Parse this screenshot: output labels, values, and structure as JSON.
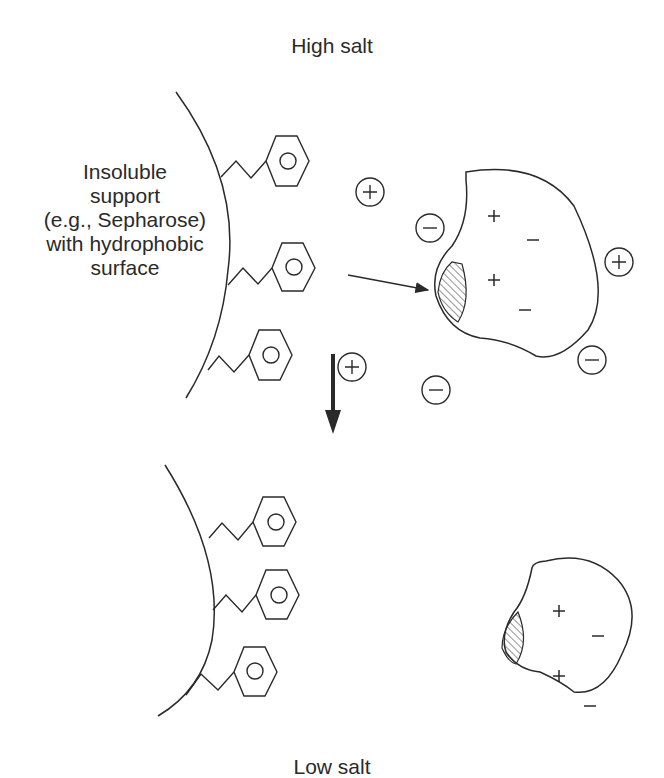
{
  "diagram": {
    "top_panel": {
      "condition_label": "High salt",
      "support_label_lines": [
        "Insoluble",
        "support",
        "(e.g., Sepharose)",
        "with hydrophobic",
        "surface"
      ],
      "ligand_icon": "phenyl-ring-icon",
      "ligand_count": 3,
      "protein_charges": [
        "+",
        "−",
        "+",
        "−"
      ],
      "free_ions": [
        "+",
        "−",
        "+",
        "−",
        "−",
        "+",
        "−"
      ],
      "binding_arrow": "arrow-left-icon"
    },
    "transition_arrow": "arrow-down-icon",
    "bottom_panel": {
      "condition_label": "Low salt",
      "ligand_count": 3,
      "protein_charges": [
        "+",
        "−",
        "+",
        "−"
      ]
    },
    "colors": {
      "line": "#2a2a2a",
      "background": "#ffffff"
    }
  }
}
